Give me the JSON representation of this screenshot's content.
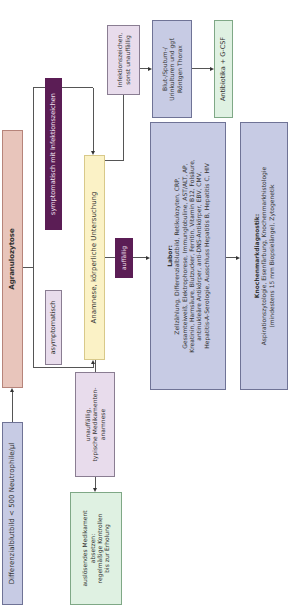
{
  "diagram": {
    "orientation": "rotated-90-ccw",
    "nodes": {
      "start": {
        "text": "Differenzialblutbild < 500 Neutrophile/µl"
      },
      "agranulozytose": {
        "text": "Agranulozytose"
      },
      "asymptomatisch": {
        "text": "asymptomatisch"
      },
      "symptomatisch": {
        "text": "symptomatisch mit Infektionszeichen"
      },
      "anamnese": {
        "text": "Anamnese, körperliche Untersuchung"
      },
      "unauffaellig": {
        "lines": [
          "unauffällig,",
          "typische Medikamenten-",
          "anamnese"
        ]
      },
      "absetzen": {
        "lines": [
          "auslösendes Medikament",
          "absetzen:",
          "regelmäßige Kontrollen",
          "bis zur Erholung"
        ]
      },
      "auffaellig": {
        "text": "auffällig"
      },
      "infektionszeichen": {
        "lines": [
          "Infektionszeichen,",
          "sonst unauffällig"
        ]
      },
      "kulturen": {
        "lines": [
          "Blut-/Sputum-/",
          "Urinkulturen und ggf.",
          "Röntgen Thorax"
        ]
      },
      "antibiotika": {
        "text": "Antibiotika + G-CSF"
      },
      "labor": {
        "title": "Labor:",
        "lines": [
          "Zellzählung, Differenzialblutbild, Retikulozyten, CRP,",
          "Gesamteiweiß, Elektrophorese, Immunglobuline, AST/ALT, AP,",
          "Kreatinin, Harnsäure, Blutzucker, Ferritin, Vitamin B12, Folsäure,",
          "antinukleäre Antikörper, anti-DNS-Antikörper, EBV, CMV,",
          "Hepatitis-A-Serologie, Ausschluss Hepatitis B, Hepatitis C, HIV"
        ]
      },
      "knochenmark": {
        "title": "Knochenmarkdiagnostik:",
        "lines": [
          "Aspirationszytologie, Eisenfärbung, Knochenmarkhistologie",
          "(mindestens 15 mm Biopsielänge), Zytogenetik"
        ]
      }
    },
    "colors": {
      "blue_box": "#c7cbe4",
      "rose_box": "#e8c5bb",
      "lilac_box": "#e8dcec",
      "yellow_box": "#fbf2c6",
      "green_box": "#dff1e2",
      "purple_label": "#5b1d55"
    }
  }
}
